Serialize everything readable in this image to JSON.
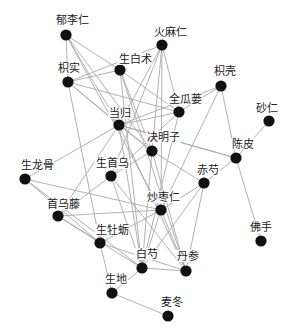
{
  "diagram": {
    "type": "network",
    "title": "",
    "colors": {
      "node": "#111111",
      "edge": "#a8a8a8",
      "label": "#222222",
      "background": "#ffffff"
    },
    "nodes": [
      {
        "id": "yuliren",
        "label": "郁李仁",
        "x": 66,
        "y": 35,
        "lx": 72,
        "ly": 24
      },
      {
        "id": "zhishi",
        "label": "枳实",
        "x": 68,
        "y": 82,
        "lx": 69,
        "ly": 72
      },
      {
        "id": "huomaren",
        "label": "火麻仁",
        "x": 162,
        "y": 45,
        "lx": 170,
        "ly": 36
      },
      {
        "id": "shengbaizhu",
        "label": "生白术",
        "x": 120,
        "y": 70,
        "lx": 135,
        "ly": 63
      },
      {
        "id": "zhike",
        "label": "枳壳",
        "x": 221,
        "y": 86,
        "lx": 225,
        "ly": 75
      },
      {
        "id": "quangualou",
        "label": "全瓜蒌",
        "x": 179,
        "y": 112,
        "lx": 185,
        "ly": 103
      },
      {
        "id": "sharen",
        "label": "砂仁",
        "x": 269,
        "y": 121,
        "lx": 267,
        "ly": 112
      },
      {
        "id": "danggui",
        "label": "当归",
        "x": 119,
        "y": 125,
        "lx": 120,
        "ly": 117
      },
      {
        "id": "juemingzi",
        "label": "决明子",
        "x": 152,
        "y": 151,
        "lx": 163,
        "ly": 141
      },
      {
        "id": "chenpi",
        "label": "陈皮",
        "x": 236,
        "y": 158,
        "lx": 243,
        "ly": 148
      },
      {
        "id": "shenglonggu",
        "label": "生龙骨",
        "x": 25,
        "y": 179,
        "lx": 37,
        "ly": 169
      },
      {
        "id": "shengshouwu",
        "label": "生首乌",
        "x": 111,
        "y": 176,
        "lx": 112,
        "ly": 167
      },
      {
        "id": "chishao",
        "label": "赤芍",
        "x": 204,
        "y": 183,
        "lx": 208,
        "ly": 174
      },
      {
        "id": "shouwuteng",
        "label": "首乌藤",
        "x": 58,
        "y": 216,
        "lx": 63,
        "ly": 208
      },
      {
        "id": "chaozaoren",
        "label": "炒枣仁",
        "x": 161,
        "y": 210,
        "lx": 163,
        "ly": 201
      },
      {
        "id": "shengmuli",
        "label": "生牡蛎",
        "x": 100,
        "y": 243,
        "lx": 112,
        "ly": 234
      },
      {
        "id": "foshou",
        "label": "佛手",
        "x": 261,
        "y": 241,
        "lx": 261,
        "ly": 231
      },
      {
        "id": "baishao",
        "label": "白芍",
        "x": 142,
        "y": 268,
        "lx": 147,
        "ly": 258
      },
      {
        "id": "danshen",
        "label": "丹参",
        "x": 186,
        "y": 271,
        "lx": 188,
        "ly": 260
      },
      {
        "id": "shengdi",
        "label": "生地",
        "x": 112,
        "y": 293,
        "lx": 116,
        "ly": 283
      },
      {
        "id": "maidong",
        "label": "麦冬",
        "x": 168,
        "y": 316,
        "lx": 172,
        "ly": 306
      }
    ],
    "edges": [
      [
        "yuliren",
        "zhishi"
      ],
      [
        "yuliren",
        "shengbaizhu"
      ],
      [
        "yuliren",
        "danggui"
      ],
      [
        "yuliren",
        "juemingzi"
      ],
      [
        "yuliren",
        "chaozaoren"
      ],
      [
        "zhishi",
        "huomaren"
      ],
      [
        "zhishi",
        "shengbaizhu"
      ],
      [
        "zhishi",
        "quangualou"
      ],
      [
        "zhishi",
        "danggui"
      ],
      [
        "zhishi",
        "juemingzi"
      ],
      [
        "zhishi",
        "shengmuli"
      ],
      [
        "huomaren",
        "danggui"
      ],
      [
        "huomaren",
        "juemingzi"
      ],
      [
        "huomaren",
        "quangualou"
      ],
      [
        "huomaren",
        "shengshouwu"
      ],
      [
        "huomaren",
        "chaozaoren"
      ],
      [
        "shengbaizhu",
        "quangualou"
      ],
      [
        "shengbaizhu",
        "juemingzi"
      ],
      [
        "shengbaizhu",
        "baishao"
      ],
      [
        "shengbaizhu",
        "danshen"
      ],
      [
        "zhike",
        "quangualou"
      ],
      [
        "zhike",
        "danggui"
      ],
      [
        "zhike",
        "chenpi"
      ],
      [
        "zhike",
        "chaozaoren"
      ],
      [
        "quangualou",
        "shengshouwu"
      ],
      [
        "quangualou",
        "danggui"
      ],
      [
        "quangualou",
        "baishao"
      ],
      [
        "sharen",
        "chenpi"
      ],
      [
        "danggui",
        "shenglonggu"
      ],
      [
        "danggui",
        "juemingzi"
      ],
      [
        "danggui",
        "shouwuteng"
      ],
      [
        "danggui",
        "baishao"
      ],
      [
        "danggui",
        "danshen"
      ],
      [
        "danggui",
        "chenpi"
      ],
      [
        "juemingzi",
        "chishao"
      ],
      [
        "juemingzi",
        "shengshouwu"
      ],
      [
        "juemingzi",
        "baishao"
      ],
      [
        "juemingzi",
        "danshen"
      ],
      [
        "chenpi",
        "chishao"
      ],
      [
        "chenpi",
        "foshou"
      ],
      [
        "chenpi",
        "danggui"
      ],
      [
        "shenglonggu",
        "chaozaoren"
      ],
      [
        "shenglonggu",
        "baishao"
      ],
      [
        "shenglonggu",
        "shengmuli"
      ],
      [
        "shengshouwu",
        "shouwuteng"
      ],
      [
        "shengshouwu",
        "baishao"
      ],
      [
        "shengshouwu",
        "danshen"
      ],
      [
        "chishao",
        "chaozaoren"
      ],
      [
        "chishao",
        "danshen"
      ],
      [
        "chishao",
        "baishao"
      ],
      [
        "shouwuteng",
        "chaozaoren"
      ],
      [
        "shouwuteng",
        "baishao"
      ],
      [
        "shouwuteng",
        "shengmuli"
      ],
      [
        "chaozaoren",
        "shengmuli"
      ],
      [
        "chaozaoren",
        "baishao"
      ],
      [
        "chaozaoren",
        "danshen"
      ],
      [
        "shengmuli",
        "danshen"
      ],
      [
        "shengmuli",
        "shengdi"
      ],
      [
        "baishao",
        "danshen"
      ],
      [
        "baishao",
        "shengdi"
      ],
      [
        "shengdi",
        "maidong"
      ]
    ]
  },
  "caption": ""
}
